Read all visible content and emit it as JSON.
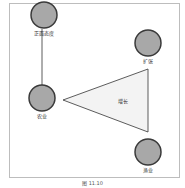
{
  "diagram": {
    "nodes": [
      {
        "id": "positive-attitude",
        "label": "正面态度",
        "shape": "circle"
      },
      {
        "id": "expansion",
        "label": "扩张",
        "shape": "circle"
      },
      {
        "id": "agriculture",
        "label": "农业",
        "shape": "circle"
      },
      {
        "id": "fishery",
        "label": "渔业",
        "shape": "circle"
      },
      {
        "id": "growth",
        "label": "增长",
        "shape": "triangle"
      }
    ],
    "edges": [
      {
        "from": "positive-attitude",
        "to": "agriculture",
        "type": "line"
      }
    ],
    "colors": {
      "node_fill": "#a8a8a8",
      "node_stroke": "#3a3a3a",
      "triangle_fill": "#f3f3f3",
      "triangle_stroke": "#333333",
      "frame": "#bdbdbd"
    }
  },
  "caption": "图 11.10"
}
